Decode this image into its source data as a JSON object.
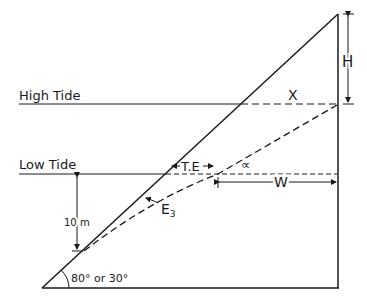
{
  "diagram": {
    "labels": {
      "high_tide": "High Tide",
      "low_tide": "Low Tide",
      "height": "H",
      "x": "X",
      "tidal_excursion": "T.E",
      "alpha": "∝",
      "width": "W",
      "e3": "E",
      "e3_sub": "3",
      "depth": "10 m",
      "angle": "80° or 30°"
    },
    "colors": {
      "line": "#1a1a1a",
      "background": "#ffffff"
    }
  }
}
